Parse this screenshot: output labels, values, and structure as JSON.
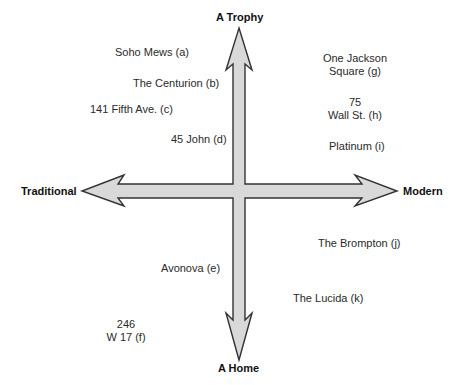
{
  "diagram": {
    "type": "perceptual-map",
    "axes": {
      "top": "A Trophy",
      "bottom": "A Home",
      "left": "Traditional",
      "right": "Modern"
    },
    "colors": {
      "arrow_fill": "#d9d9d9",
      "arrow_stroke": "#333333",
      "text": "#2a2a2a"
    },
    "items": [
      {
        "id": "a",
        "line1": "Soho Mews (a)",
        "line2": ""
      },
      {
        "id": "b",
        "line1": "The Centurion (b)",
        "line2": ""
      },
      {
        "id": "c",
        "line1": "141 Fifth Ave. (c)",
        "line2": ""
      },
      {
        "id": "d",
        "line1": "45 John (d)",
        "line2": ""
      },
      {
        "id": "e",
        "line1": "Avonova (e)",
        "line2": ""
      },
      {
        "id": "f",
        "line1": "246",
        "line2": "W 17 (f)"
      },
      {
        "id": "g",
        "line1": "One Jackson",
        "line2": "Square (g)"
      },
      {
        "id": "h",
        "line1": "75",
        "line2": "Wall St. (h)"
      },
      {
        "id": "i",
        "line1": "Platinum (i)",
        "line2": ""
      },
      {
        "id": "j",
        "line1": "The Brompton (j)",
        "line2": ""
      },
      {
        "id": "k",
        "line1": "The Lucida (k)",
        "line2": ""
      }
    ]
  }
}
